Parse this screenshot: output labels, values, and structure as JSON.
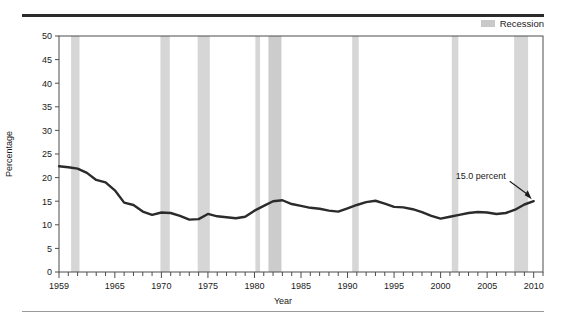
{
  "figure": {
    "legend": {
      "swatch_name": "recession-swatch",
      "label": "Recession",
      "color": "#c9c9c9"
    },
    "annotation": {
      "text": "15.0 percent"
    },
    "rules": {
      "top_color": "#2b2b2b",
      "bottom_color": "#9b9b9b"
    }
  },
  "chart_data": {
    "type": "line",
    "title": "",
    "xlabel": "Year",
    "ylabel": "Percentage",
    "xlim": [
      1959,
      2011
    ],
    "ylim": [
      0,
      50
    ],
    "grid": false,
    "legend_position": "top-right",
    "line_color": "#2b2b2b",
    "xticks": [
      1959,
      1965,
      1970,
      1975,
      1980,
      1985,
      1990,
      1995,
      2000,
      2005,
      2010
    ],
    "xtick_labels": [
      "1959",
      "1965",
      "1970",
      "1975",
      "1980",
      "1985",
      "1990",
      "1995",
      "2000",
      "2005",
      "2010"
    ],
    "xminor_step": 1,
    "yticks": [
      0,
      5,
      10,
      15,
      20,
      25,
      30,
      35,
      40,
      45,
      50
    ],
    "ytick_labels": [
      "0",
      "5",
      "10",
      "15",
      "20",
      "25",
      "30",
      "35",
      "40",
      "45",
      "50"
    ],
    "series": [
      {
        "name": "Poverty rate",
        "x": [
          1959,
          1960,
          1961,
          1962,
          1963,
          1964,
          1965,
          1966,
          1967,
          1968,
          1969,
          1970,
          1971,
          1972,
          1973,
          1974,
          1975,
          1976,
          1977,
          1978,
          1979,
          1980,
          1981,
          1982,
          1983,
          1984,
          1985,
          1986,
          1987,
          1988,
          1989,
          1990,
          1991,
          1992,
          1993,
          1994,
          1995,
          1996,
          1997,
          1998,
          1999,
          2000,
          2001,
          2002,
          2003,
          2004,
          2005,
          2006,
          2007,
          2008,
          2009,
          2010
        ],
        "values": [
          22.4,
          22.2,
          21.9,
          21.0,
          19.5,
          19.0,
          17.3,
          14.7,
          14.2,
          12.8,
          12.1,
          12.6,
          12.5,
          11.9,
          11.1,
          11.2,
          12.3,
          11.8,
          11.6,
          11.4,
          11.7,
          13.0,
          14.0,
          15.0,
          15.2,
          14.4,
          14.0,
          13.6,
          13.4,
          13.0,
          12.8,
          13.5,
          14.2,
          14.8,
          15.1,
          14.5,
          13.8,
          13.7,
          13.3,
          12.7,
          11.9,
          11.3,
          11.7,
          12.1,
          12.5,
          12.7,
          12.6,
          12.3,
          12.5,
          13.2,
          14.3,
          15.0
        ]
      }
    ],
    "recession_bands": [
      {
        "start": 1960.3,
        "end": 1961.2
      },
      {
        "start": 1969.9,
        "end": 1970.9
      },
      {
        "start": 1973.9,
        "end": 1975.2
      },
      {
        "start": 1980.1,
        "end": 1980.6
      },
      {
        "start": 1981.5,
        "end": 1982.9
      },
      {
        "start": 1990.5,
        "end": 1991.2
      },
      {
        "start": 2001.2,
        "end": 2001.9
      },
      {
        "start": 2007.9,
        "end": 2009.4
      }
    ],
    "annotations": [
      {
        "text": "15.0 percent",
        "x": 2010,
        "y": 15.0
      }
    ]
  }
}
